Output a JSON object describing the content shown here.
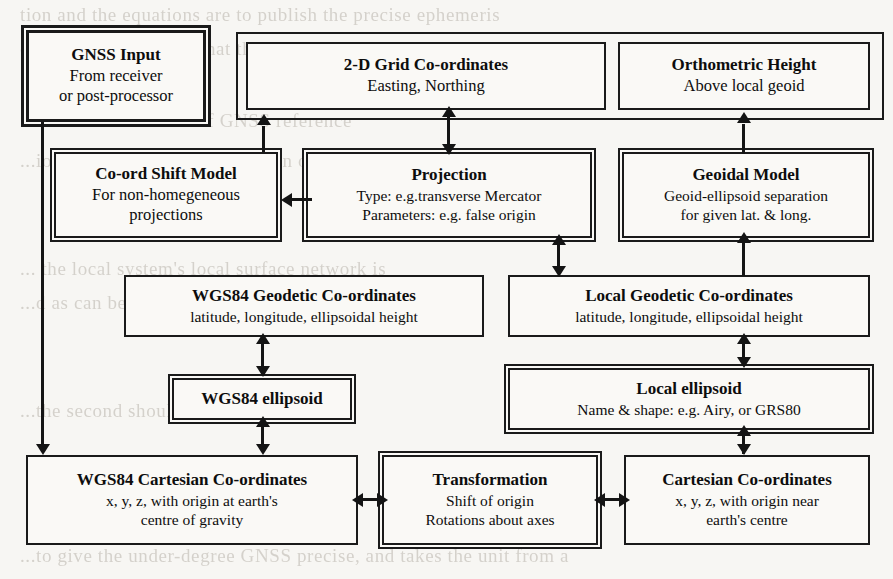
{
  "diagram": {
    "nodes": {
      "gnss_input": {
        "title": "GNSS Input",
        "lines": [
          "From receiver",
          "or post-processor"
        ]
      },
      "grid_coords": {
        "title": "2-D Grid Co-ordinates",
        "lines": [
          "Easting, Northing"
        ]
      },
      "orthometric": {
        "title": "Orthometric Height",
        "lines": [
          "Above local geoid"
        ]
      },
      "coord_shift": {
        "title": "Co-ord Shift Model",
        "lines": [
          "For non-homegeneous",
          "projections"
        ]
      },
      "projection": {
        "title": "Projection",
        "lines": [
          "Type: e.g.transverse Mercator",
          "Parameters: e.g. false origin"
        ]
      },
      "geoidal_model": {
        "title": "Geoidal Model",
        "lines": [
          "Geoid-ellipsoid separation",
          "for given lat. & long."
        ]
      },
      "wgs84_geodetic": {
        "title": "WGS84 Geodetic Co-ordinates",
        "lines": [
          "latitude, longitude, ellipsoidal height"
        ]
      },
      "local_geodetic": {
        "title": "Local Geodetic Co-ordinates",
        "lines": [
          "latitude, longitude, ellipsoidal height"
        ]
      },
      "wgs84_ellipsoid": {
        "title": "WGS84 ellipsoid",
        "lines": []
      },
      "local_ellipsoid": {
        "title": "Local ellipsoid",
        "lines": [
          "Name & shape: e.g. Airy, or GRS80"
        ]
      },
      "wgs84_cartesian": {
        "title": "WGS84 Cartesian Co-ordinates",
        "lines": [
          "x, y, z, with origin at earth's",
          "centre of gravity"
        ]
      },
      "transformation": {
        "title": "Transformation",
        "lines": [
          "Shift of origin",
          "Rotations about axes"
        ]
      },
      "cartesian": {
        "title": "Cartesian Co-ordinates",
        "lines": [
          "x, y, z, with origin near",
          "earth's centre"
        ]
      }
    },
    "colors": {
      "ink": "#1a1a1a",
      "paper": "#f7f6f3",
      "box_fill": "#faf9f6",
      "bleed_text": "#b9b4ac"
    }
  },
  "background_text": {
    "lines": [
      "tion and the equations are to publish the precise ephemeris",
      "of the actual orbit, so that the user can then use this",
      "... wide area network of GNSS reference",
      "... be calculated in the",
      "...ion as the orbital determination of WGS84 and the",
      "... the local system's local surface network is",
      "...d as can be determined from the ...",
      "...the second should be measured ...",
      "...to give the under-degree GNSS precise, and takes the unit from a"
    ]
  }
}
